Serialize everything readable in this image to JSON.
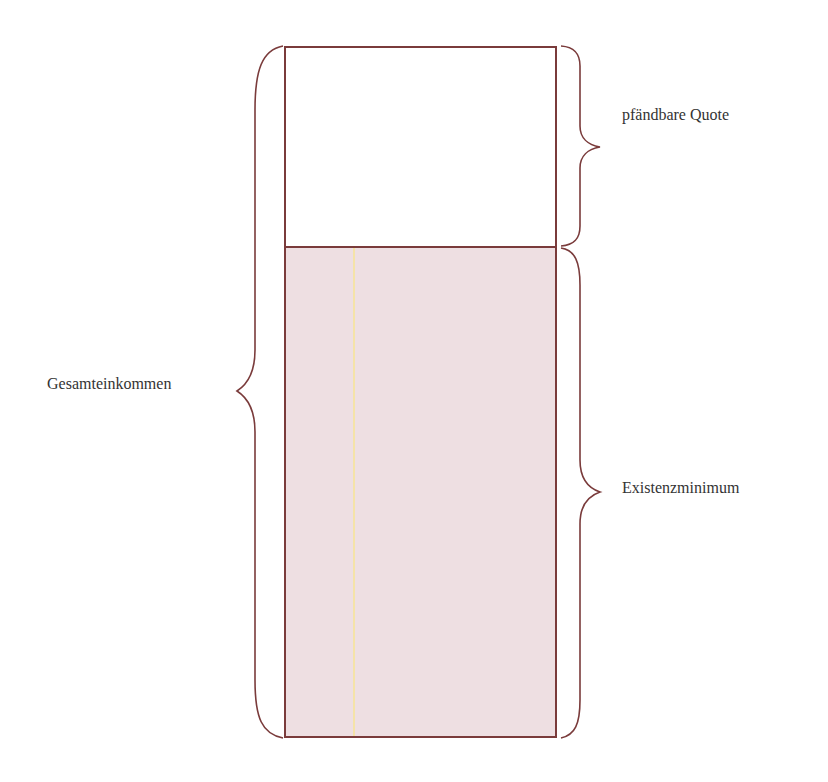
{
  "diagram": {
    "type": "stacked-box-with-braces",
    "labels": {
      "total": "Gesamteinkommen",
      "seizable": "pfändbare Quote",
      "minimum": "Existenzminimum"
    },
    "colors": {
      "outline": "#7a3b3b",
      "minimum_fill": "#eedfe2",
      "seizable_fill": "#ffffff",
      "text": "#333333",
      "guide_line": "#f5e3a8"
    },
    "segments": [
      {
        "name": "pfändbare Quote",
        "position": "top",
        "relative_height": 0.29
      },
      {
        "name": "Existenzminimum",
        "position": "bottom",
        "relative_height": 0.71
      }
    ]
  }
}
